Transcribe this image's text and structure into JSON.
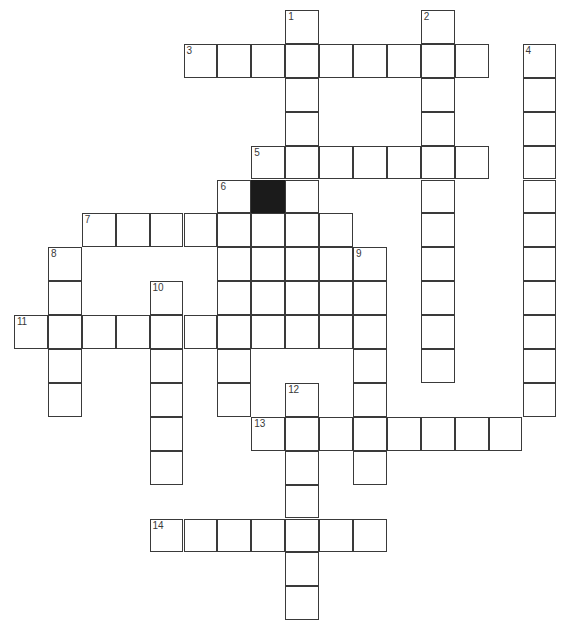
{
  "puzzle": {
    "kind": "crossword-grid",
    "title": "",
    "geometry": {
      "origin_x": 14,
      "origin_y": 10,
      "cell_size": 33.9,
      "columns": 16,
      "rows": 18,
      "line_color": "#3a3a3a",
      "cell_fill": "#ffffff",
      "block_fill": "#1b1b1b",
      "background": "#ffffff"
    },
    "entries": [
      {
        "number": "1",
        "direction": "down",
        "row": 0,
        "col": 8,
        "length": 7
      },
      {
        "number": "2",
        "direction": "down",
        "row": 0,
        "col": 12,
        "length": 11
      },
      {
        "number": "3",
        "direction": "across",
        "row": 1,
        "col": 5,
        "length": 9
      },
      {
        "number": "4",
        "direction": "down",
        "row": 1,
        "col": 15,
        "length": 12
      },
      {
        "number": "5",
        "direction": "across",
        "row": 4,
        "col": 7,
        "length": 7
      },
      {
        "number": "6",
        "direction": "down",
        "row": 5,
        "col": 6,
        "length": 4
      },
      {
        "number": "7",
        "direction": "across",
        "row": 6,
        "col": 2,
        "length": 8
      },
      {
        "number": "8",
        "direction": "down",
        "row": 7,
        "col": 1,
        "length": 5
      },
      {
        "number": "9",
        "direction": "down",
        "row": 7,
        "col": 10,
        "length": 7
      },
      {
        "number": "10",
        "direction": "down",
        "row": 8,
        "col": 4,
        "length": 7
      },
      {
        "number": "11",
        "direction": "across",
        "row": 9,
        "col": 0,
        "length": 11
      },
      {
        "number": "12",
        "direction": "down",
        "row": 11,
        "col": 8,
        "length": 7
      },
      {
        "number": "13",
        "direction": "across",
        "row": 12,
        "col": 7,
        "length": 8
      },
      {
        "number": "14",
        "direction": "across",
        "row": 15,
        "col": 4,
        "length": 7
      }
    ],
    "cells": [
      {
        "row": 0,
        "col": 8,
        "number": "1",
        "letter": "",
        "block": false
      },
      {
        "row": 0,
        "col": 12,
        "number": "2",
        "letter": "",
        "block": false
      },
      {
        "row": 1,
        "col": 5,
        "number": "3",
        "letter": "",
        "block": false
      },
      {
        "row": 1,
        "col": 6,
        "number": "",
        "letter": "",
        "block": false
      },
      {
        "row": 1,
        "col": 7,
        "number": "",
        "letter": "",
        "block": false
      },
      {
        "row": 1,
        "col": 8,
        "number": "",
        "letter": "",
        "block": false
      },
      {
        "row": 1,
        "col": 9,
        "number": "",
        "letter": "",
        "block": false
      },
      {
        "row": 1,
        "col": 10,
        "number": "",
        "letter": "",
        "block": false
      },
      {
        "row": 1,
        "col": 11,
        "number": "",
        "letter": "",
        "block": false
      },
      {
        "row": 1,
        "col": 12,
        "number": "",
        "letter": "",
        "block": false
      },
      {
        "row": 1,
        "col": 13,
        "number": "",
        "letter": "",
        "block": false
      },
      {
        "row": 1,
        "col": 15,
        "number": "4",
        "letter": "",
        "block": false
      },
      {
        "row": 2,
        "col": 8,
        "number": "",
        "letter": "",
        "block": false
      },
      {
        "row": 2,
        "col": 12,
        "number": "",
        "letter": "",
        "block": false
      },
      {
        "row": 2,
        "col": 15,
        "number": "",
        "letter": "",
        "block": false
      },
      {
        "row": 3,
        "col": 8,
        "number": "",
        "letter": "",
        "block": false
      },
      {
        "row": 3,
        "col": 12,
        "number": "",
        "letter": "",
        "block": false
      },
      {
        "row": 3,
        "col": 15,
        "number": "",
        "letter": "",
        "block": false
      },
      {
        "row": 4,
        "col": 7,
        "number": "5",
        "letter": "",
        "block": false
      },
      {
        "row": 4,
        "col": 8,
        "number": "",
        "letter": "",
        "block": false
      },
      {
        "row": 4,
        "col": 9,
        "number": "",
        "letter": "",
        "block": false
      },
      {
        "row": 4,
        "col": 10,
        "number": "",
        "letter": "",
        "block": false
      },
      {
        "row": 4,
        "col": 11,
        "number": "",
        "letter": "",
        "block": false
      },
      {
        "row": 4,
        "col": 12,
        "number": "",
        "letter": "",
        "block": false
      },
      {
        "row": 4,
        "col": 13,
        "number": "",
        "letter": "",
        "block": false
      },
      {
        "row": 4,
        "col": 15,
        "number": "",
        "letter": "",
        "block": false
      },
      {
        "row": 5,
        "col": 6,
        "number": "6",
        "letter": "",
        "block": false
      },
      {
        "row": 5,
        "col": 7,
        "number": "",
        "letter": "",
        "block": true
      },
      {
        "row": 5,
        "col": 8,
        "number": "",
        "letter": "",
        "block": false
      },
      {
        "row": 5,
        "col": 12,
        "number": "",
        "letter": "",
        "block": false
      },
      {
        "row": 5,
        "col": 15,
        "number": "",
        "letter": "",
        "block": false
      },
      {
        "row": 6,
        "col": 2,
        "number": "7",
        "letter": "",
        "block": false
      },
      {
        "row": 6,
        "col": 3,
        "number": "",
        "letter": "",
        "block": false
      },
      {
        "row": 6,
        "col": 4,
        "number": "",
        "letter": "",
        "block": false
      },
      {
        "row": 6,
        "col": 5,
        "number": "",
        "letter": "",
        "block": false
      },
      {
        "row": 6,
        "col": 6,
        "number": "",
        "letter": "",
        "block": false
      },
      {
        "row": 6,
        "col": 7,
        "number": "",
        "letter": "",
        "block": false
      },
      {
        "row": 6,
        "col": 8,
        "number": "",
        "letter": "",
        "block": false
      },
      {
        "row": 6,
        "col": 9,
        "number": "",
        "letter": "",
        "block": false
      },
      {
        "row": 6,
        "col": 12,
        "number": "",
        "letter": "",
        "block": false
      },
      {
        "row": 6,
        "col": 15,
        "number": "",
        "letter": "",
        "block": false
      },
      {
        "row": 7,
        "col": 1,
        "number": "8",
        "letter": "",
        "block": false
      },
      {
        "row": 7,
        "col": 6,
        "number": "",
        "letter": "",
        "block": false
      },
      {
        "row": 7,
        "col": 7,
        "number": "",
        "letter": "",
        "block": false
      },
      {
        "row": 7,
        "col": 8,
        "number": "",
        "letter": "",
        "block": false
      },
      {
        "row": 7,
        "col": 9,
        "number": "",
        "letter": "",
        "block": false
      },
      {
        "row": 7,
        "col": 10,
        "number": "9",
        "letter": "",
        "block": false
      },
      {
        "row": 7,
        "col": 12,
        "number": "",
        "letter": "",
        "block": false
      },
      {
        "row": 7,
        "col": 15,
        "number": "",
        "letter": "",
        "block": false
      },
      {
        "row": 8,
        "col": 1,
        "number": "",
        "letter": "",
        "block": false
      },
      {
        "row": 8,
        "col": 4,
        "number": "10",
        "letter": "",
        "block": false
      },
      {
        "row": 8,
        "col": 6,
        "number": "",
        "letter": "",
        "block": false
      },
      {
        "row": 8,
        "col": 7,
        "number": "",
        "letter": "",
        "block": false
      },
      {
        "row": 8,
        "col": 8,
        "number": "",
        "letter": "",
        "block": false
      },
      {
        "row": 8,
        "col": 9,
        "number": "",
        "letter": "",
        "block": false
      },
      {
        "row": 8,
        "col": 10,
        "number": "",
        "letter": "",
        "block": false
      },
      {
        "row": 8,
        "col": 12,
        "number": "",
        "letter": "",
        "block": false
      },
      {
        "row": 8,
        "col": 15,
        "number": "",
        "letter": "",
        "block": false
      },
      {
        "row": 9,
        "col": 0,
        "number": "11",
        "letter": "",
        "block": false
      },
      {
        "row": 9,
        "col": 1,
        "number": "",
        "letter": "",
        "block": false
      },
      {
        "row": 9,
        "col": 2,
        "number": "",
        "letter": "",
        "block": false
      },
      {
        "row": 9,
        "col": 3,
        "number": "",
        "letter": "",
        "block": false
      },
      {
        "row": 9,
        "col": 4,
        "number": "",
        "letter": "",
        "block": false
      },
      {
        "row": 9,
        "col": 5,
        "number": "",
        "letter": "",
        "block": false
      },
      {
        "row": 9,
        "col": 6,
        "number": "",
        "letter": "",
        "block": false
      },
      {
        "row": 9,
        "col": 7,
        "number": "",
        "letter": "",
        "block": false
      },
      {
        "row": 9,
        "col": 8,
        "number": "",
        "letter": "",
        "block": false
      },
      {
        "row": 9,
        "col": 9,
        "number": "",
        "letter": "",
        "block": false
      },
      {
        "row": 9,
        "col": 10,
        "number": "",
        "letter": "",
        "block": false
      },
      {
        "row": 9,
        "col": 12,
        "number": "",
        "letter": "",
        "block": false
      },
      {
        "row": 9,
        "col": 15,
        "number": "",
        "letter": "",
        "block": false
      },
      {
        "row": 10,
        "col": 1,
        "number": "",
        "letter": "",
        "block": false
      },
      {
        "row": 10,
        "col": 4,
        "number": "",
        "letter": "",
        "block": false
      },
      {
        "row": 10,
        "col": 6,
        "number": "",
        "letter": "",
        "block": false
      },
      {
        "row": 10,
        "col": 10,
        "number": "",
        "letter": "",
        "block": false
      },
      {
        "row": 10,
        "col": 12,
        "number": "",
        "letter": "",
        "block": false
      },
      {
        "row": 10,
        "col": 15,
        "number": "",
        "letter": "",
        "block": false
      },
      {
        "row": 11,
        "col": 1,
        "number": "",
        "letter": "",
        "block": false
      },
      {
        "row": 11,
        "col": 4,
        "number": "",
        "letter": "",
        "block": false
      },
      {
        "row": 11,
        "col": 6,
        "number": "",
        "letter": "",
        "block": false
      },
      {
        "row": 11,
        "col": 8,
        "number": "12",
        "letter": "",
        "block": false
      },
      {
        "row": 11,
        "col": 10,
        "number": "",
        "letter": "",
        "block": false
      },
      {
        "row": 11,
        "col": 15,
        "number": "",
        "letter": "",
        "block": false
      },
      {
        "row": 12,
        "col": 4,
        "number": "",
        "letter": "",
        "block": false
      },
      {
        "row": 12,
        "col": 7,
        "number": "13",
        "letter": "",
        "block": false
      },
      {
        "row": 12,
        "col": 8,
        "number": "",
        "letter": "",
        "block": false
      },
      {
        "row": 12,
        "col": 9,
        "number": "",
        "letter": "",
        "block": false
      },
      {
        "row": 12,
        "col": 10,
        "number": "",
        "letter": "",
        "block": false
      },
      {
        "row": 12,
        "col": 11,
        "number": "",
        "letter": "",
        "block": false
      },
      {
        "row": 12,
        "col": 12,
        "number": "",
        "letter": "",
        "block": false
      },
      {
        "row": 12,
        "col": 13,
        "number": "",
        "letter": "",
        "block": false
      },
      {
        "row": 12,
        "col": 14,
        "number": "",
        "letter": "",
        "block": false
      },
      {
        "row": 13,
        "col": 4,
        "number": "",
        "letter": "",
        "block": false
      },
      {
        "row": 13,
        "col": 8,
        "number": "",
        "letter": "",
        "block": false
      },
      {
        "row": 13,
        "col": 10,
        "number": "",
        "letter": "",
        "block": false
      },
      {
        "row": 14,
        "col": 8,
        "number": "",
        "letter": "",
        "block": false
      },
      {
        "row": 15,
        "col": 4,
        "number": "14",
        "letter": "",
        "block": false
      },
      {
        "row": 15,
        "col": 5,
        "number": "",
        "letter": "",
        "block": false
      },
      {
        "row": 15,
        "col": 6,
        "number": "",
        "letter": "",
        "block": false
      },
      {
        "row": 15,
        "col": 7,
        "number": "",
        "letter": "",
        "block": false
      },
      {
        "row": 15,
        "col": 8,
        "number": "",
        "letter": "",
        "block": false
      },
      {
        "row": 15,
        "col": 9,
        "number": "",
        "letter": "",
        "block": false
      },
      {
        "row": 15,
        "col": 10,
        "number": "",
        "letter": "",
        "block": false
      },
      {
        "row": 16,
        "col": 8,
        "number": "",
        "letter": "",
        "block": false
      },
      {
        "row": 17,
        "col": 8,
        "number": "",
        "letter": "",
        "block": false
      }
    ]
  }
}
